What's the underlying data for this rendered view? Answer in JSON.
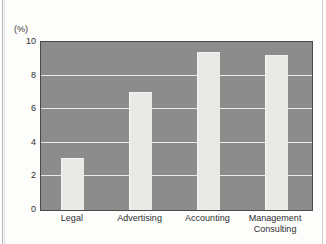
{
  "chart_data": {
    "type": "bar",
    "title": "",
    "subtitle": "",
    "xlabel": "",
    "ylabel": "(%)",
    "unit_label": "(%)",
    "categories": [
      "Legal",
      "Advertising",
      "Accounting",
      "Management\nConsulting"
    ],
    "values": [
      3.1,
      7.0,
      9.4,
      9.2
    ],
    "ylim": [
      0,
      10
    ],
    "ytick_labels": [
      "0",
      "2",
      "4",
      "6",
      "8",
      "10"
    ],
    "ytick_values": [
      0,
      2,
      4,
      6,
      8,
      10
    ],
    "grid": true,
    "grid_axis": "y",
    "legend": false,
    "legend_position": "none",
    "series": [
      {
        "name": "",
        "values": [
          3.1,
          7.0,
          9.4,
          9.2
        ]
      }
    ]
  },
  "style": {
    "plot_background": "#8c8c8c",
    "bar_color": "#e9e9e6",
    "gridline_color": "#f2f2f0",
    "frame_color": "#4a4a4a",
    "text_color": "#2f2f2f",
    "page_background": "#fdfdfc"
  }
}
